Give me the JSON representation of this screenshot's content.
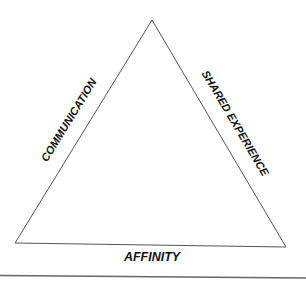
{
  "diagram": {
    "type": "triangle",
    "vertices": {
      "top": [
        152,
        20
      ],
      "bottom_left": [
        15,
        243
      ],
      "bottom_right": [
        286,
        247
      ]
    },
    "labels": {
      "left_side": "COMMUNICATION",
      "right_side": "SHARED EXPERIENCE",
      "bottom_side": "AFFINITY"
    },
    "colors": {
      "line": "#555555",
      "text": "#111111",
      "background": "#ffffff"
    }
  }
}
